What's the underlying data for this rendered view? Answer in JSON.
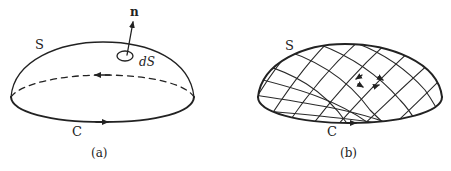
{
  "figure_a": {
    "surface_label": "S",
    "normal_label": "n",
    "area_element_label": "dS",
    "boundary_label": "C",
    "caption": "(a)"
  },
  "figure_b": {
    "surface_label": "S",
    "boundary_label": "C",
    "caption": "(b)"
  },
  "colors": {
    "line": "#222222",
    "background": "#ffffff"
  }
}
